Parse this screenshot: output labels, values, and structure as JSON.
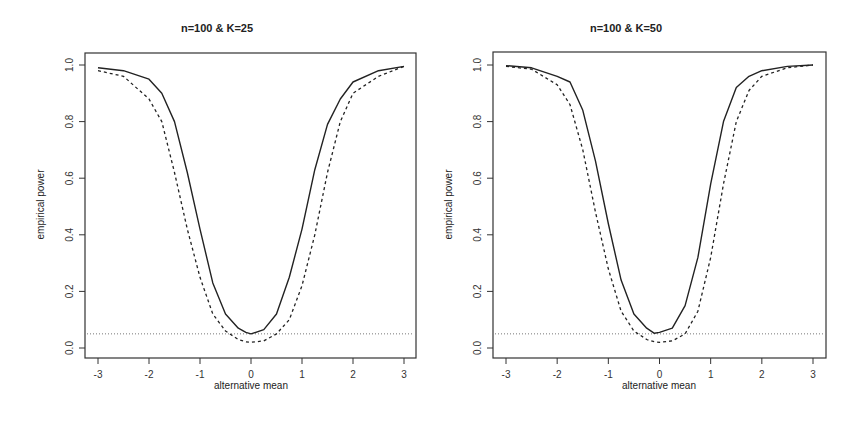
{
  "chart_data": [
    {
      "type": "line",
      "title": "n=100 & K=25",
      "xlabel": "alternative mean",
      "ylabel": "empirical power",
      "xlim": [
        -3,
        3
      ],
      "ylim": [
        0,
        1
      ],
      "xticks": [
        "-3",
        "-2",
        "-1",
        "0",
        "1",
        "2",
        "3"
      ],
      "yticks": [
        "0.0",
        "0.2",
        "0.4",
        "0.6",
        "0.8",
        "1.0"
      ],
      "grid": false,
      "reference_line": {
        "y": 0.05,
        "style": "dotted"
      },
      "x": [
        -3,
        -2.5,
        -2,
        -1.75,
        -1.5,
        -1.25,
        -1,
        -0.75,
        -0.5,
        -0.25,
        -0.1,
        0,
        0.25,
        0.5,
        0.75,
        1,
        1.25,
        1.5,
        1.75,
        2,
        2.5,
        3
      ],
      "series": [
        {
          "name": "solid",
          "style": "solid",
          "values": [
            0.99,
            0.98,
            0.95,
            0.9,
            0.8,
            0.62,
            0.42,
            0.23,
            0.12,
            0.07,
            0.055,
            0.05,
            0.065,
            0.12,
            0.25,
            0.42,
            0.63,
            0.79,
            0.88,
            0.94,
            0.98,
            0.995
          ]
        },
        {
          "name": "dashed",
          "style": "dashed",
          "values": [
            0.98,
            0.96,
            0.88,
            0.8,
            0.62,
            0.42,
            0.25,
            0.12,
            0.06,
            0.03,
            0.022,
            0.02,
            0.025,
            0.05,
            0.1,
            0.22,
            0.4,
            0.62,
            0.8,
            0.9,
            0.96,
            0.995
          ]
        }
      ]
    },
    {
      "type": "line",
      "title": "n=100 & K=50",
      "xlabel": "alternative mean",
      "ylabel": "empirical power",
      "xlim": [
        -3,
        3
      ],
      "ylim": [
        0,
        1
      ],
      "xticks": [
        "-3",
        "-2",
        "-1",
        "0",
        "1",
        "2",
        "3"
      ],
      "yticks": [
        "0.0",
        "0.2",
        "0.4",
        "0.6",
        "0.8",
        "1.0"
      ],
      "grid": false,
      "reference_line": {
        "y": 0.05,
        "style": "dotted"
      },
      "x": [
        -3,
        -2.5,
        -2,
        -1.75,
        -1.5,
        -1.25,
        -1,
        -0.75,
        -0.5,
        -0.25,
        -0.1,
        0,
        0.25,
        0.5,
        0.75,
        1,
        1.25,
        1.5,
        1.75,
        2,
        2.5,
        3
      ],
      "series": [
        {
          "name": "solid",
          "style": "solid",
          "values": [
            0.998,
            0.99,
            0.96,
            0.94,
            0.84,
            0.66,
            0.44,
            0.24,
            0.12,
            0.07,
            0.052,
            0.055,
            0.07,
            0.15,
            0.32,
            0.58,
            0.8,
            0.92,
            0.96,
            0.98,
            0.995,
            1.0
          ]
        },
        {
          "name": "dashed",
          "style": "dashed",
          "values": [
            0.995,
            0.985,
            0.93,
            0.86,
            0.7,
            0.48,
            0.28,
            0.13,
            0.06,
            0.03,
            0.022,
            0.02,
            0.025,
            0.05,
            0.13,
            0.32,
            0.58,
            0.8,
            0.91,
            0.96,
            0.99,
            1.0
          ]
        }
      ]
    }
  ]
}
